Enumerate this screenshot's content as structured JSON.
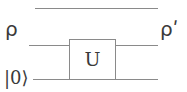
{
  "figure": {
    "type": "quantum-circuit-diagram",
    "background_color": "#ffffff",
    "line_color": "#8a8a8a",
    "text_color": "#3a3a3a"
  },
  "labels": {
    "input_state": "ρ",
    "output_state": "ρʹ",
    "ancilla_state": "|0⟩"
  },
  "gate": {
    "label": "U",
    "x": 69,
    "y": 39,
    "width": 47,
    "height": 41
  },
  "wires": [
    {
      "name": "top-wire",
      "y": 8,
      "x1": 35,
      "x2": 158,
      "segment": "full"
    },
    {
      "name": "middle-wire-left",
      "y": 45,
      "x1": 29,
      "x2": 69,
      "segment": "left"
    },
    {
      "name": "middle-wire-right",
      "y": 45,
      "x1": 116,
      "x2": 158,
      "segment": "right"
    },
    {
      "name": "bottom-wire-left",
      "y": 79,
      "x1": 33,
      "x2": 69,
      "segment": "left"
    },
    {
      "name": "bottom-wire-right",
      "y": 79,
      "x1": 116,
      "x2": 158,
      "segment": "right"
    }
  ]
}
